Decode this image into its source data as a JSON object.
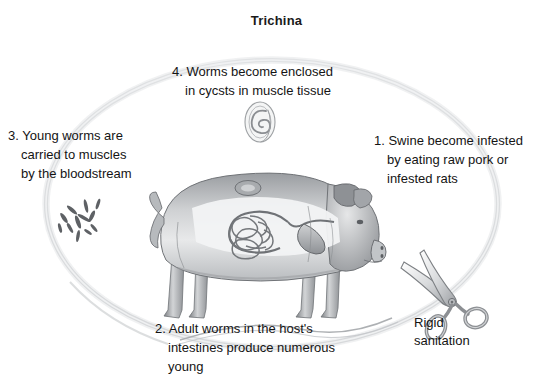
{
  "figure": {
    "title": "Trichina",
    "background_color": "#ffffff",
    "ink_color": "#141414",
    "ring_color": "#c9cbcd",
    "illustration_color": "#8c8f93"
  },
  "steps": [
    {
      "id": "step-1",
      "number": "1.",
      "lines": [
        "1. Swine become infested",
        "by eating raw pork or",
        "infested rats"
      ]
    },
    {
      "id": "step-2",
      "number": "2.",
      "lines": [
        "2. Adult worms in the host's",
        "intestines produce numerous",
        "young"
      ]
    },
    {
      "id": "step-3",
      "number": "3.",
      "lines": [
        "3. Young worms are",
        "carried to muscles",
        "by the bloodstream"
      ]
    },
    {
      "id": "step-4",
      "number": "4.",
      "lines": [
        "4. Worms become enclosed",
        "in cycsts in muscle tissue"
      ]
    }
  ],
  "annotations": {
    "sanitation": {
      "lines": [
        "Rigid",
        "sanitation"
      ]
    }
  },
  "illustrations": {
    "pig": "pig-anatomy-illustration",
    "scissors": "scissors-illustration",
    "cyst": "encysted-worm-illustration",
    "larvae": "larvae-cluster-illustration",
    "cycle_ring": "life-cycle-ring-arrow"
  }
}
